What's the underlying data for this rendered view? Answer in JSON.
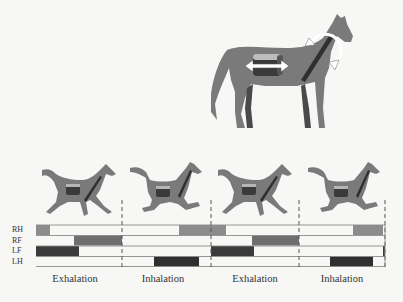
{
  "figure": {
    "standing_horse": {
      "icon": "standing-horse-illustration",
      "features": [
        "lung-piston-cylinder",
        "double-headed-horizontal-arrow",
        "diagonal-spine-bar",
        "curved-neck-arrow"
      ]
    },
    "gait_frames": [
      {
        "phase": "Exhalation",
        "pose": "extended-gallop"
      },
      {
        "phase": "Inhalation",
        "pose": "gathered-gallop"
      },
      {
        "phase": "Exhalation",
        "pose": "extended-gallop"
      },
      {
        "phase": "Inhalation",
        "pose": "gathered-gallop"
      }
    ],
    "phase_labels": [
      "Exhalation",
      "Inhalation",
      "Exhalation",
      "Inhalation"
    ],
    "row_labels": [
      "RH",
      "RF",
      "LF",
      "LH"
    ],
    "colors": {
      "background": "#f7f7f5",
      "horse_body": "#7a7a7a",
      "horse_dark": "#3c3c3c",
      "RH": "#8c8c8c",
      "RF": "#6f6f6f",
      "LF": "#3b3b3b",
      "LH": "#2f2f2f",
      "grid_line": "#8a8a8a"
    }
  },
  "chart_data": {
    "type": "gantt",
    "xlabel": "Stride cycle",
    "rows": [
      "RH",
      "RF",
      "LF",
      "LH"
    ],
    "x_range_px": [
      36,
      385
    ],
    "phase_boundaries_px": [
      36,
      122,
      211,
      299,
      385
    ],
    "phases": [
      "Exhalation",
      "Inhalation",
      "Exhalation",
      "Inhalation"
    ],
    "stance_segments": {
      "RH": [
        [
          36,
          50
        ],
        [
          179,
          226
        ],
        [
          353,
          383
        ]
      ],
      "RF": [
        [
          74,
          122
        ],
        [
          252,
          299
        ]
      ],
      "LF": [
        [
          36,
          79
        ],
        [
          211,
          254
        ],
        [
          383,
          385
        ]
      ],
      "LH": [
        [
          154,
          199
        ],
        [
          330,
          373
        ]
      ]
    },
    "legend": {
      "RH": "right hind",
      "RF": "right fore",
      "LF": "left fore",
      "LH": "left hind"
    }
  }
}
